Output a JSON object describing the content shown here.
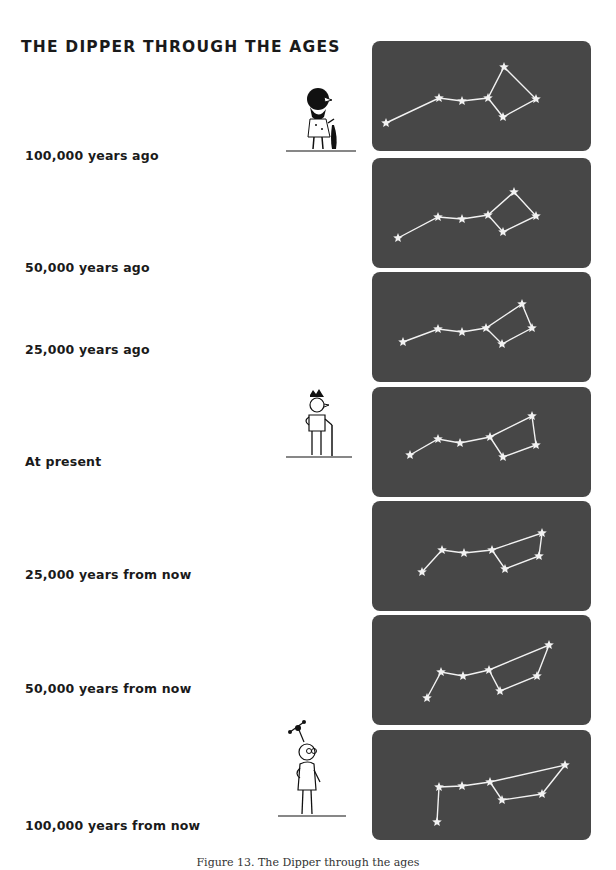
{
  "title": "THE DIPPER THROUGH THE AGES",
  "caption": "Figure 13. The Dipper through the ages",
  "star_color": "#f2f2f2",
  "panel_color": "#474747",
  "rows": [
    {
      "label": "100,000 years ago",
      "label_top": 148,
      "panel_top": 41,
      "stars": [
        [
          14,
          82
        ],
        [
          67,
          57
        ],
        [
          90,
          60
        ],
        [
          116,
          57
        ],
        [
          132,
          26
        ],
        [
          164,
          58
        ],
        [
          131,
          76
        ]
      ],
      "figure": "caveman"
    },
    {
      "label": "50,000 years ago",
      "label_top": 260,
      "panel_top": 158,
      "stars": [
        [
          26,
          80
        ],
        [
          66,
          59
        ],
        [
          90,
          61
        ],
        [
          116,
          57
        ],
        [
          142,
          34
        ],
        [
          164,
          58
        ],
        [
          131,
          74
        ]
      ],
      "figure": null
    },
    {
      "label": "25,000 years ago",
      "label_top": 342,
      "panel_top": 272,
      "stars": [
        [
          31,
          70
        ],
        [
          66,
          57
        ],
        [
          90,
          60
        ],
        [
          114,
          56
        ],
        [
          150,
          32
        ],
        [
          160,
          56
        ],
        [
          130,
          72
        ]
      ],
      "figure": null
    },
    {
      "label": "At present",
      "label_top": 454,
      "panel_top": 387,
      "stars": [
        [
          38,
          68
        ],
        [
          66,
          52
        ],
        [
          88,
          56
        ],
        [
          118,
          50
        ],
        [
          160,
          29
        ],
        [
          164,
          58
        ],
        [
          131,
          70
        ]
      ],
      "figure": "modern-man"
    },
    {
      "label": "25,000 years from now",
      "label_top": 567,
      "panel_top": 501,
      "stars": [
        [
          50,
          71
        ],
        [
          70,
          49
        ],
        [
          92,
          52
        ],
        [
          120,
          49
        ],
        [
          170,
          32
        ],
        [
          167,
          55
        ],
        [
          133,
          68
        ]
      ],
      "figure": null
    },
    {
      "label": "50,000 years from now",
      "label_top": 681,
      "panel_top": 615,
      "stars": [
        [
          55,
          83
        ],
        [
          69,
          57
        ],
        [
          91,
          61
        ],
        [
          117,
          55
        ],
        [
          177,
          30
        ],
        [
          165,
          61
        ],
        [
          128,
          76
        ]
      ],
      "figure": null
    },
    {
      "label": "100,000 years from now",
      "label_top": 818,
      "panel_top": 730,
      "stars": [
        [
          65,
          92
        ],
        [
          67,
          57
        ],
        [
          90,
          56
        ],
        [
          118,
          52
        ],
        [
          193,
          35
        ],
        [
          170,
          64
        ],
        [
          130,
          70
        ]
      ],
      "figure": "future-man"
    }
  ],
  "chart_data": {
    "type": "scatter",
    "title": "THE DIPPER THROUGH THE AGES",
    "categories": [
      "100,000 years ago",
      "50,000 years ago",
      "25,000 years ago",
      "At present",
      "25,000 years from now",
      "50,000 years from now",
      "100,000 years from now"
    ],
    "series": [
      {
        "name": "Big Dipper star positions (panel px)",
        "values": "see rows[].stars"
      }
    ]
  }
}
